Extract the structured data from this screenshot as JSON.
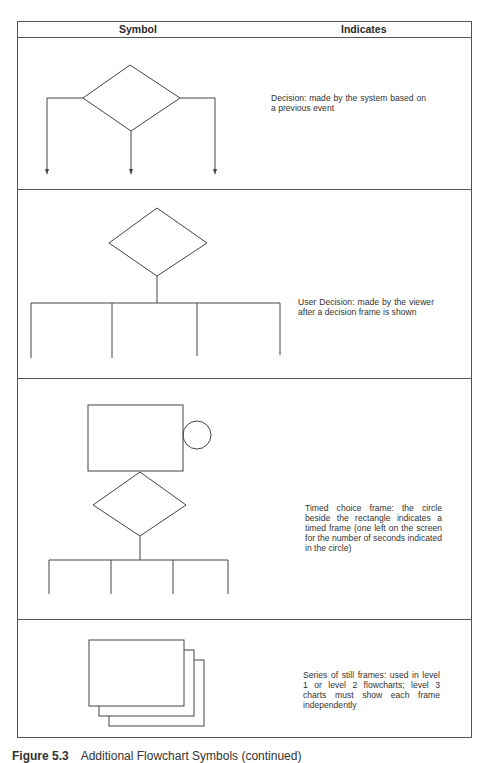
{
  "table": {
    "headers": {
      "symbol": "Symbol",
      "indicates": "Indicates"
    },
    "rows": [
      {
        "symbol": "decision-diamond-three-arrows",
        "description": "Decision: made by the system based on a previous event"
      },
      {
        "symbol": "user-decision-diamond-branches",
        "description": "User Decision: made by the viewer after a decision frame is shown"
      },
      {
        "symbol": "timed-choice-frame",
        "description": "Timed choice frame: the circle beside the rectangle indicates a timed frame (one left on the screen for the number of seconds indicated in the circle)"
      },
      {
        "symbol": "stacked-still-frames",
        "description": "Series of still frames: used in level 1 or level 2 flowcharts; level 3 charts must show each frame independently"
      }
    ]
  },
  "caption": {
    "label": "Figure 5.3",
    "text": "Additional Flowchart Symbols (continued)"
  },
  "colors": {
    "line": "#444444",
    "text": "#333333",
    "background": "#ffffff"
  }
}
